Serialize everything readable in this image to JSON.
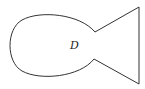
{
  "diagram": {
    "type": "region-boundary",
    "shape": "fish",
    "region_label": "D",
    "stroke_color": "#333333",
    "fill_color": "#ffffff"
  }
}
